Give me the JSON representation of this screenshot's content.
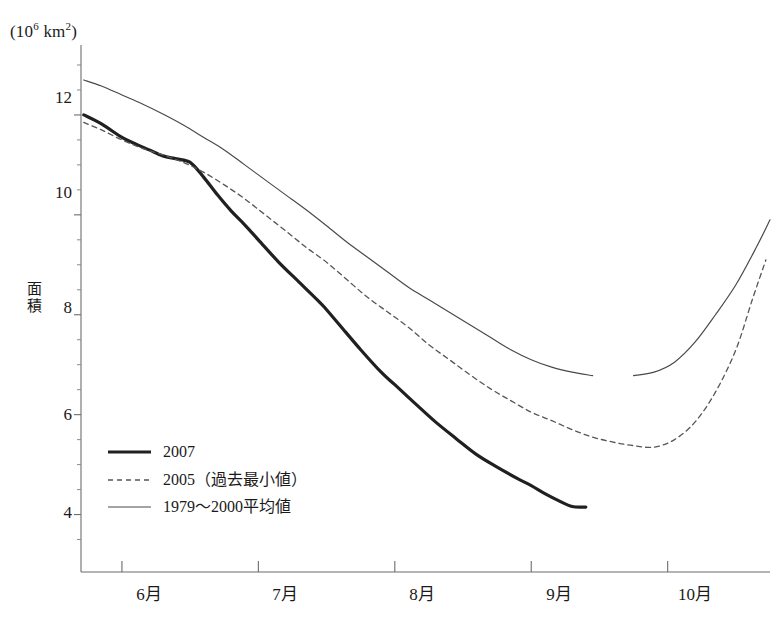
{
  "figure": {
    "unit_label_prefix": "(10",
    "unit_label_exp": "6",
    "unit_label_suffix_a": " km",
    "unit_label_exp2": "2",
    "unit_label_close": ")",
    "y_axis_title_chars": [
      "面",
      "積"
    ],
    "background_color": "#ffffff",
    "axis_color": "#6d6d6d"
  },
  "chart_data": {
    "type": "line",
    "title": "",
    "subtitle": "",
    "xlabel": "",
    "ylabel": "面積",
    "unit": "(10^6 km^2)",
    "grid": false,
    "legend_position": "lower-left-inside",
    "x_tick_labels": [
      "6月",
      "7月",
      "8月",
      "9月",
      "10月"
    ],
    "x_tick_label_kind": "month-interval-centered",
    "x_axis_range_months": [
      5.7,
      10.75
    ],
    "y_tick_labels": [
      "4",
      "6",
      "8",
      "10",
      "12"
    ],
    "y_major_ticks": [
      4,
      6,
      8,
      10,
      12
    ],
    "y_minor_tick_step": 0.5,
    "ylim": [
      2.85,
      13.4
    ],
    "series": [
      {
        "name": "2007",
        "legend_label": "2007",
        "style": "solid-thick",
        "color": "#221f1f",
        "width": 3.2,
        "x": [
          5.72,
          5.85,
          6.0,
          6.1,
          6.2,
          6.3,
          6.4,
          6.5,
          6.6,
          6.7,
          6.8,
          6.9,
          7.0,
          7.15,
          7.3,
          7.45,
          7.5,
          7.6,
          7.75,
          7.9,
          8.0,
          8.15,
          8.3,
          8.45,
          8.6,
          8.75,
          8.9,
          9.0,
          9.1,
          9.2,
          9.3,
          9.4
        ],
        "y": [
          12.0,
          11.82,
          11.55,
          11.42,
          11.3,
          11.18,
          11.12,
          11.05,
          10.75,
          10.4,
          10.08,
          9.8,
          9.5,
          9.05,
          8.65,
          8.25,
          8.1,
          7.78,
          7.3,
          6.85,
          6.6,
          6.22,
          5.85,
          5.52,
          5.2,
          4.95,
          4.72,
          4.58,
          4.42,
          4.28,
          4.16,
          4.15
        ]
      },
      {
        "name": "2005",
        "legend_label": "2005（過去最小値）",
        "style": "dashed",
        "color": "#56565a",
        "width": 1.3,
        "x": [
          5.72,
          5.85,
          6.0,
          6.15,
          6.3,
          6.45,
          6.6,
          6.75,
          6.9,
          7.05,
          7.2,
          7.35,
          7.5,
          7.65,
          7.8,
          7.95,
          8.1,
          8.25,
          8.4,
          8.55,
          8.7,
          8.85,
          9.0,
          9.15,
          9.3,
          9.45,
          9.6,
          9.75,
          9.9,
          10.05,
          10.2,
          10.35,
          10.5,
          10.62,
          10.72
        ],
        "y": [
          11.85,
          11.7,
          11.5,
          11.33,
          11.2,
          11.05,
          10.85,
          10.6,
          10.32,
          10.0,
          9.68,
          9.35,
          9.05,
          8.7,
          8.35,
          8.05,
          7.75,
          7.4,
          7.1,
          6.8,
          6.52,
          6.28,
          6.05,
          5.88,
          5.7,
          5.55,
          5.45,
          5.38,
          5.35,
          5.5,
          5.85,
          6.45,
          7.3,
          8.3,
          9.1
        ]
      },
      {
        "name": "1979-2000 average",
        "legend_label": "1979〜2000平均値",
        "style": "solid-thin",
        "color": "#4a4a4e",
        "width": 1.2,
        "x": [
          5.72,
          5.85,
          6.0,
          6.15,
          6.3,
          6.45,
          6.6,
          6.75,
          6.9,
          7.05,
          7.2,
          7.35,
          7.5,
          7.65,
          7.8,
          7.95,
          8.1,
          8.25,
          8.4,
          8.55,
          8.7,
          8.85,
          9.0,
          9.15,
          9.3,
          9.45,
          9.6,
          9.75,
          9.9,
          10.05,
          10.2,
          10.35,
          10.5,
          10.65,
          10.75
        ],
        "y": [
          12.7,
          12.58,
          12.4,
          12.22,
          12.02,
          11.8,
          11.55,
          11.3,
          11.0,
          10.7,
          10.4,
          10.1,
          9.78,
          9.45,
          9.15,
          8.85,
          8.55,
          8.3,
          8.05,
          7.8,
          7.55,
          7.3,
          7.1,
          6.95,
          6.85,
          6.78,
          6.75,
          6.78,
          6.85,
          7.05,
          7.45,
          8.0,
          8.6,
          9.35,
          9.9
        ]
      }
    ],
    "annotations": [
      {
        "kind": "line-break-gap",
        "series": "1979-2000 average",
        "x_range": [
          9.0,
          9.08
        ]
      },
      {
        "kind": "line-break-gap",
        "series": "1979-2000 average",
        "x_range": [
          9.55,
          9.62
        ]
      }
    ]
  },
  "legend": {
    "entries": [
      {
        "label": "2007",
        "style": "solid-thick"
      },
      {
        "label": "2005（過去最小値）",
        "style": "dashed"
      },
      {
        "label": "1979〜2000平均値",
        "style": "solid-thin"
      }
    ]
  }
}
